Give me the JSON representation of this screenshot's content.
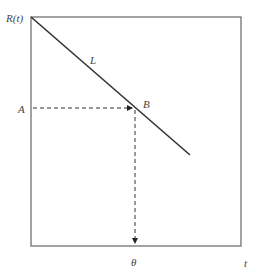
{
  "diagram": {
    "y_axis_label": "R(t)",
    "x_axis_label": "t",
    "line_label": "L",
    "point_label": "B",
    "y_marker_label": "A",
    "x_marker_label": "θ",
    "colors": {
      "line": "#333333",
      "frame": "#666666",
      "dashed": "#333333",
      "text": "#444444"
    }
  }
}
